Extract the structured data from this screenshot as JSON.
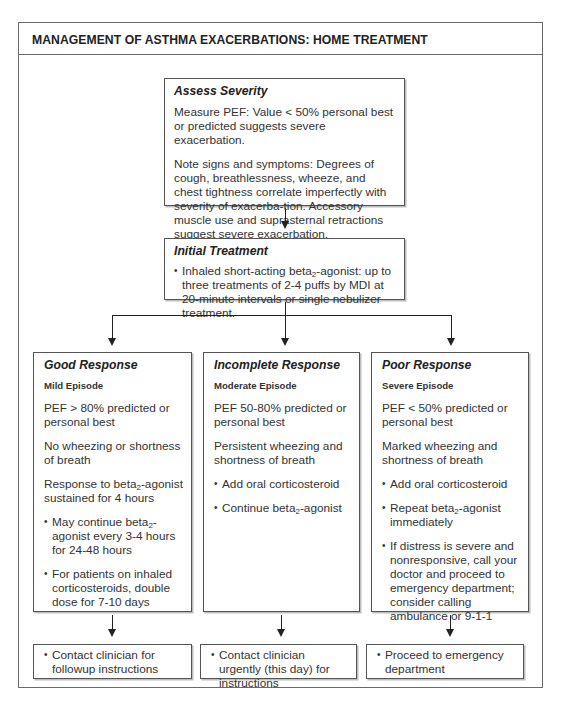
{
  "header": {
    "title": "MANAGEMENT OF ASTHMA EXACERBATIONS: HOME TREATMENT"
  },
  "assess": {
    "title": "Assess Severity",
    "p1": "Measure PEF: Value < 50% personal best or predicted suggests severe exacerbation.",
    "p2": "Note signs and symptoms: Degrees of cough, breathlessness, wheeze, and chest tightness correlate imperfectly with severity of exacerba-tion. Accessory muscle use and suprasternal retractions suggest severe exacerbation."
  },
  "initial": {
    "title": "Initial Treatment",
    "bullet_pre": "Inhaled short-acting beta",
    "bullet_sub": "2",
    "bullet_post": "-agonist: up to three treatments of 2-4 puffs by MDI at 20-minute intervals or single nebulizer treatment."
  },
  "responses": [
    {
      "title": "Good Response",
      "episode": "Mild Episode",
      "p1": "PEF > 80% predicted or personal best",
      "p2": "No wheezing or shortness of breath",
      "p3_pre": "Response to beta",
      "p3_sub": "2",
      "p3_post": "-agonist sustained for 4 hours",
      "b1_pre": "May continue beta",
      "b1_sub": "2",
      "b1_post": "-agonist every 3-4 hours for 24-48 hours",
      "b2": "For patients on inhaled corticosteroids, double dose for 7-10 days",
      "outcome": "Contact clinician for followup instructions"
    },
    {
      "title": "Incomplete Response",
      "episode": "Moderate Episode",
      "p1": "PEF 50-80% predicted or personal best",
      "p2": "Persistent wheezing and shortness of breath",
      "b1": "Add oral corticosteroid",
      "b2_pre": "Continue beta",
      "b2_sub": "2",
      "b2_post": "-agonist",
      "outcome": "Contact clinician urgently (this day) for instructions"
    },
    {
      "title": "Poor Response",
      "episode": "Severe Episode",
      "p1": "PEF < 50% predicted or personal best",
      "p2": "Marked wheezing and shortness of breath",
      "b1": "Add oral corticosteroid",
      "b2_pre": "Repeat beta",
      "b2_sub": "2",
      "b2_post": "-agonist immediately",
      "b3": "If distress is severe and nonresponsive, call your doctor and proceed to emergency department; consider calling ambulance or 9-1-1",
      "outcome": "Proceed to emergency department"
    }
  ]
}
